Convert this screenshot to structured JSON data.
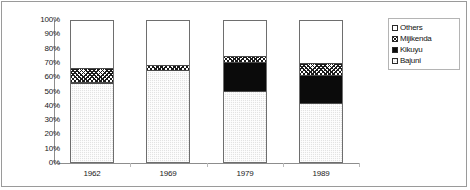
{
  "chart_data": {
    "type": "bar",
    "subtype": "stacked-percentage-column",
    "title": "",
    "subtitle": "",
    "xlabel": "",
    "ylabel": "",
    "categories": [
      "1962",
      "1969",
      "1979",
      "1989"
    ],
    "ylim": [
      0,
      100
    ],
    "ytick_labels": [
      "0%",
      "10%",
      "20%",
      "30%",
      "40%",
      "50%",
      "60%",
      "70%",
      "80%",
      "90%",
      "100%"
    ],
    "ytick_values": [
      0,
      10,
      20,
      30,
      40,
      50,
      60,
      70,
      80,
      90,
      100
    ],
    "grid": false,
    "legend_position": "right",
    "legend_order": [
      "Others",
      "Mijikenda",
      "Kikuyu",
      "Bajuni"
    ],
    "stack_order_bottom_to_top": [
      "Bajuni",
      "Kikuyu",
      "Mijikenda",
      "Others"
    ],
    "series": [
      {
        "name": "Bajuni",
        "values": [
          56,
          65,
          50,
          42
        ]
      },
      {
        "name": "Kikuyu",
        "values": [
          1,
          0,
          21,
          20
        ]
      },
      {
        "name": "Mijikenda",
        "values": [
          10,
          4,
          4,
          8
        ]
      },
      {
        "name": "Others",
        "values": [
          33,
          31,
          25,
          30
        ]
      }
    ],
    "patterns": {
      "Others": "solid-white",
      "Mijikenda": "diagonal-crosshatch",
      "Kikuyu": "solid-black",
      "Bajuni": "light-gray-dotted"
    },
    "colors": {
      "Others": "#ffffff",
      "Mijikenda": "#ffffff",
      "Kikuyu": "#0b0b0b",
      "Bajuni": "#e3e3e3",
      "outline": "#6e6e6e",
      "axis": "#8d8d8d",
      "frame": "#9a9a9a",
      "text": "#1a1a1a"
    }
  },
  "legend": {
    "items": [
      {
        "label": "Others",
        "key": "Others"
      },
      {
        "label": "Mijikenda",
        "key": "Mijikenda"
      },
      {
        "label": "Kikuyu",
        "key": "Kikuyu"
      },
      {
        "label": "Bajuni",
        "key": "Bajuni"
      }
    ]
  },
  "axis": {
    "y_labels": [
      "100%",
      "90%",
      "80%",
      "70%",
      "60%",
      "50%",
      "40%",
      "30%",
      "20%",
      "10%",
      "0%"
    ],
    "x_labels": [
      "1962",
      "1969",
      "1979",
      "1989"
    ]
  }
}
